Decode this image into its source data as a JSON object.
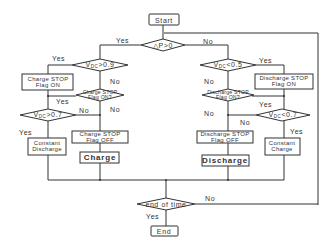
{
  "diagram": {
    "type": "flowchart",
    "nodes": {
      "start": "Start",
      "p_check": "△P>0",
      "vdc_gt_09": {
        "prefix": "V",
        "sub": "DC",
        "suffix": ">0.9"
      },
      "charge_stop_flag_on_box": {
        "line1": "Charge STOP",
        "line2": "Flag ON"
      },
      "charge_stop_flag_on_q": {
        "line1": "Charge STOP",
        "line2": "Flag ON?"
      },
      "vdc_gt_07": {
        "prefix": "V",
        "sub": "DC",
        "suffix": ">0.7"
      },
      "constant_discharge": {
        "line1": "Constant",
        "line2": "Discharge"
      },
      "charge_stop_flag_off_box": {
        "line1": "Charge STOP",
        "line2": "Flag OFF"
      },
      "charge": "Charge",
      "vdc_lt_05": {
        "prefix": "V",
        "sub": "DC",
        "suffix": "<0.5"
      },
      "discharge_stop_flag_on_box": {
        "line1": "Discharge STOP",
        "line2": "Flag ON"
      },
      "discharge_stop_flag_on_q": {
        "line1": "Discharge STOP",
        "line2": "Flag ON?"
      },
      "vdc_lt_07": {
        "prefix": "V",
        "sub": "DC",
        "suffix": "<0.7"
      },
      "constant_charge": {
        "line1": "Constant",
        "line2": "Charge"
      },
      "discharge_stop_flag_off_box": {
        "line1": "Discharge STOP",
        "line2": "Flag OFF"
      },
      "discharge": "Discharge",
      "end_of_time": "end of time",
      "end": "End"
    },
    "edge_labels": {
      "p_yes": "Yes",
      "p_no": "No",
      "v09_yes": "Yes",
      "v09_no": "No",
      "cflag_yes": "Yes",
      "cflag_no": "No",
      "v07_yes": "Yes",
      "v07_no": "No",
      "v05_yes": "Yes",
      "v05_no": "No",
      "dflag_yes": "Yes",
      "dflag_no": "No",
      "vlt07_yes": "Yes",
      "vlt07_no": "No",
      "eot_yes": "Yes",
      "eot_no": "No"
    }
  }
}
